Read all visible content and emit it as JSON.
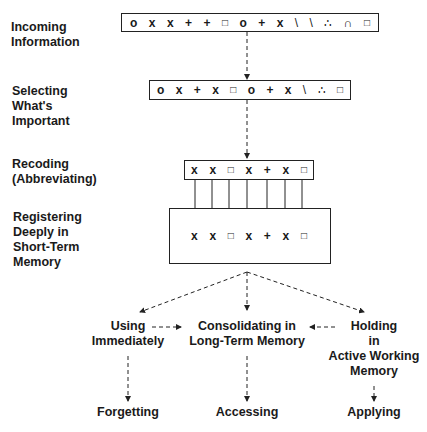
{
  "stages": [
    {
      "id": "incoming",
      "label_lines": [
        "Incoming",
        "Information"
      ],
      "symbols": [
        "o",
        "x",
        "x",
        "+",
        "+",
        "□",
        "o",
        "+",
        "x",
        "\\",
        "\\",
        "∴",
        "∩",
        "□"
      ]
    },
    {
      "id": "selecting",
      "label_lines": [
        "Selecting",
        "What's",
        "Important"
      ],
      "symbols": [
        "o",
        "x",
        "+",
        "x",
        "□",
        "o",
        "+",
        "x",
        "\\",
        "∴",
        "□"
      ]
    },
    {
      "id": "recoding",
      "label_lines": [
        "Recoding",
        "(Abbreviating)"
      ],
      "symbols": [
        "x",
        "x",
        "□",
        "x",
        "+",
        "x",
        "□"
      ]
    },
    {
      "id": "registering",
      "label_lines": [
        "Registering",
        "Deeply in",
        "Short-Term",
        "Memory"
      ],
      "symbols": [
        "x",
        "x",
        "□",
        "x",
        "+",
        "x",
        "□"
      ]
    }
  ],
  "outcomes": {
    "using": {
      "label_lines": [
        "Using",
        "Immediately"
      ]
    },
    "consolidating": {
      "label_lines": [
        "Consolidating in",
        "Long-Term Memory"
      ]
    },
    "holding": {
      "label_lines": [
        "Holding",
        "in",
        "Active Working",
        "Memory"
      ]
    }
  },
  "results": {
    "forgetting": "Forgetting",
    "accessing": "Accessing",
    "applying": "Applying"
  }
}
